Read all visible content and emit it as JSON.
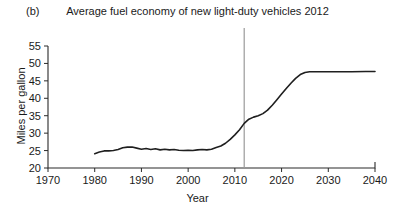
{
  "figure": {
    "panel_label": "(b)",
    "title": "Average fuel economy of new light-duty vehicles 2012"
  },
  "axes": {
    "xlabel": "Year",
    "ylabel": "Miles per gallon"
  },
  "chart_data": {
    "type": "line",
    "title": "Average fuel economy of new light-duty vehicles 2012",
    "panel_label": "(b)",
    "xlabel": "Year",
    "ylabel": "Miles per gallon",
    "xlim": [
      1970,
      2040
    ],
    "ylim": [
      20,
      55
    ],
    "xticks": [
      1970,
      1980,
      1990,
      2000,
      2010,
      2020,
      2030,
      2040
    ],
    "yticks": [
      20,
      25,
      30,
      35,
      40,
      45,
      50,
      55
    ],
    "grid": false,
    "legend": null,
    "annotations": [
      {
        "type": "vertical-line",
        "name": "reference-line-2012",
        "x": 2012,
        "color": "#9a9a9a"
      }
    ],
    "series": [
      {
        "name": "Average fuel economy of new light-duty vehicles",
        "color": "#1f1f1f",
        "x": [
          1980,
          1981,
          1982,
          1983,
          1984,
          1985,
          1986,
          1987,
          1988,
          1989,
          1990,
          1991,
          1992,
          1993,
          1994,
          1995,
          1996,
          1997,
          1998,
          1999,
          2000,
          2001,
          2002,
          2003,
          2004,
          2005,
          2006,
          2007,
          2008,
          2009,
          2010,
          2011,
          2012,
          2013,
          2014,
          2015,
          2016,
          2017,
          2018,
          2019,
          2020,
          2021,
          2022,
          2023,
          2024,
          2025,
          2026,
          2027,
          2028,
          2030,
          2032,
          2035,
          2038,
          2040
        ],
        "y": [
          24.1,
          24.6,
          24.9,
          24.9,
          25.0,
          25.3,
          25.8,
          26.0,
          26.0,
          25.7,
          25.4,
          25.6,
          25.3,
          25.5,
          25.2,
          25.4,
          25.2,
          25.3,
          25.1,
          25.0,
          25.1,
          25.0,
          25.2,
          25.3,
          25.2,
          25.4,
          25.9,
          26.3,
          27.1,
          28.2,
          29.5,
          31.0,
          32.8,
          34.0,
          34.6,
          35.0,
          35.6,
          36.6,
          38.0,
          39.6,
          41.2,
          42.8,
          44.3,
          45.7,
          46.8,
          47.4,
          47.6,
          47.6,
          47.6,
          47.6,
          47.6,
          47.6,
          47.7,
          47.7
        ]
      }
    ]
  }
}
